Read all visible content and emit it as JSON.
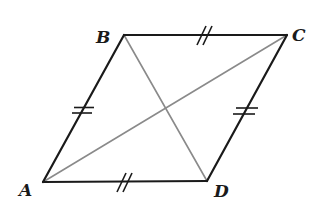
{
  "diagram": {
    "type": "parallelogram-rhombus",
    "colors": {
      "side": "#1a1a1a",
      "diagonal": "#8a8a8a",
      "background": "#ffffff"
    },
    "vertices": {
      "A": {
        "x": 43,
        "y": 182
      },
      "B": {
        "x": 124,
        "y": 35
      },
      "C": {
        "x": 287,
        "y": 35
      },
      "D": {
        "x": 207,
        "y": 181
      }
    },
    "labels": {
      "A": "A",
      "B": "B",
      "C": "C",
      "D": "D"
    },
    "sides": [
      {
        "from": "A",
        "to": "B",
        "mark": "double-bar"
      },
      {
        "from": "B",
        "to": "C",
        "mark": "double-slash"
      },
      {
        "from": "C",
        "to": "D",
        "mark": "double-bar"
      },
      {
        "from": "D",
        "to": "A",
        "mark": "double-slash"
      }
    ],
    "diagonals": [
      {
        "from": "A",
        "to": "C"
      },
      {
        "from": "B",
        "to": "D"
      }
    ]
  }
}
